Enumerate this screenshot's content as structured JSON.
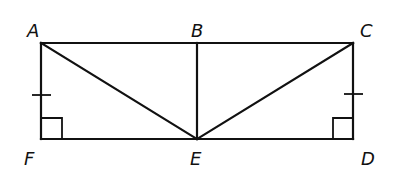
{
  "diagram": {
    "title": "",
    "points": {
      "A": {
        "label": "A",
        "x": 41,
        "y": 43
      },
      "B": {
        "label": "B",
        "x": 197,
        "y": 43
      },
      "C": {
        "label": "C",
        "x": 353,
        "y": 43
      },
      "D": {
        "label": "D",
        "x": 353,
        "y": 139
      },
      "E": {
        "label": "E",
        "x": 197,
        "y": 139
      },
      "F": {
        "label": "F",
        "x": 41,
        "y": 139
      }
    },
    "segments": [
      "AB",
      "BC",
      "CD",
      "DE",
      "EF",
      "FA",
      "AE",
      "BE",
      "CE"
    ],
    "congruence_marks": [
      {
        "segment": "AF",
        "ticks": 1
      },
      {
        "segment": "CD",
        "ticks": 1
      }
    ],
    "right_angles": [
      "F",
      "D"
    ],
    "colors": {
      "stroke": "#111111",
      "background": "#ffffff"
    }
  }
}
